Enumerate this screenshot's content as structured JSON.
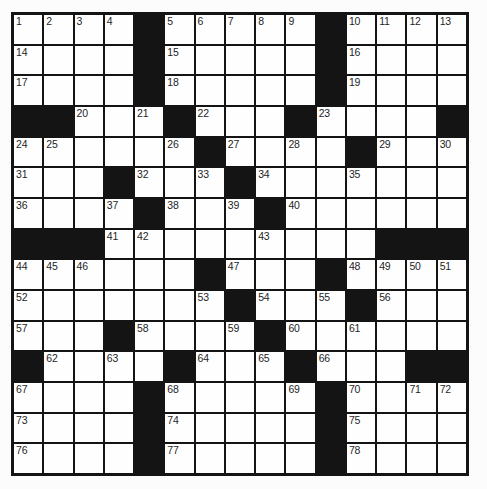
{
  "app": {
    "type": "crossword-puzzle",
    "description": "Empty 15x15 crossword puzzle grid, scanned style"
  },
  "colors": {
    "page_bg": "#fcfcfc",
    "grid_line": "#141414",
    "black_cell": "#141414",
    "white_cell": "#fefefe",
    "number_text": "#1e1e1e"
  },
  "puzzle": {
    "rows": 15,
    "cols": 15,
    "black_symbol": "#",
    "first_number": "1",
    "last_number": "78",
    "grid": [
      [
        "1",
        "2",
        "3",
        "4",
        "#",
        "5",
        "6",
        "7",
        "8",
        "9",
        "#",
        "10",
        "11",
        "12",
        "13"
      ],
      [
        "14",
        "",
        "",
        "",
        "#",
        "15",
        "",
        "",
        "",
        "",
        "#",
        "16",
        "",
        "",
        ""
      ],
      [
        "17",
        "",
        "",
        "",
        "#",
        "18",
        "",
        "",
        "",
        "",
        "#",
        "19",
        "",
        "",
        ""
      ],
      [
        "#",
        "#",
        "20",
        "",
        "21",
        "#",
        "22",
        "",
        "",
        "#",
        "23",
        "",
        "",
        "",
        "#"
      ],
      [
        "24",
        "25",
        "",
        "",
        "",
        "26",
        "#",
        "27",
        "",
        "28",
        "",
        "#",
        "29",
        "",
        "30"
      ],
      [
        "31",
        "",
        "",
        "#",
        "32",
        "",
        "33",
        "#",
        "34",
        "",
        "",
        "35",
        "",
        "",
        ""
      ],
      [
        "36",
        "",
        "",
        "37",
        "#",
        "38",
        "",
        "39",
        "#",
        "40",
        "",
        "",
        "",
        "",
        ""
      ],
      [
        "#",
        "#",
        "#",
        "41",
        "42",
        "",
        "",
        "",
        "43",
        "",
        "",
        "",
        "#",
        "#",
        "#"
      ],
      [
        "44",
        "45",
        "46",
        "",
        "",
        "",
        "#",
        "47",
        "",
        "",
        "#",
        "48",
        "49",
        "50",
        "51"
      ],
      [
        "52",
        "",
        "",
        "",
        "",
        "",
        "53",
        "#",
        "54",
        "",
        "55",
        "#",
        "56",
        "",
        ""
      ],
      [
        "57",
        "",
        "",
        "#",
        "58",
        "",
        "",
        "59",
        "#",
        "60",
        "",
        "61",
        "",
        "",
        ""
      ],
      [
        "#",
        "62",
        "",
        "63",
        "",
        "#",
        "64",
        "",
        "65",
        "#",
        "66",
        "",
        "",
        "#",
        "#"
      ],
      [
        "67",
        "",
        "",
        "",
        "#",
        "68",
        "",
        "",
        "",
        "69",
        "#",
        "70",
        "",
        "71",
        "72"
      ],
      [
        "73",
        "",
        "",
        "",
        "#",
        "74",
        "",
        "",
        "",
        "",
        "#",
        "75",
        "",
        "",
        ""
      ],
      [
        "76",
        "",
        "",
        "",
        "#",
        "77",
        "",
        "",
        "",
        "",
        "#",
        "78",
        "",
        "",
        ""
      ]
    ]
  }
}
